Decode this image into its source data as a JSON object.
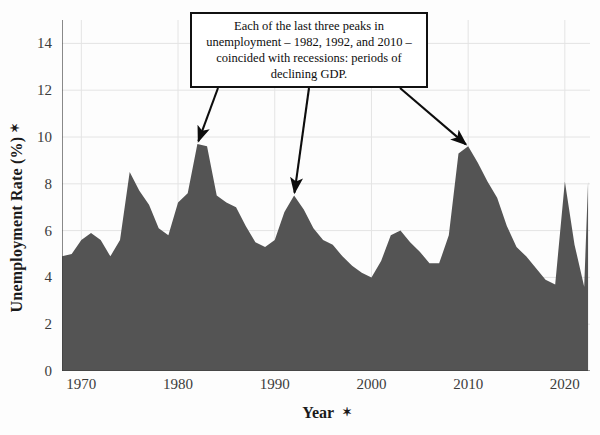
{
  "chart_data": {
    "type": "area",
    "title": "",
    "xlabel": "Year",
    "ylabel": "Unemployment Rate (%)",
    "xlabel_suffix": "✶",
    "ylabel_suffix": "✶",
    "xlim": [
      1968,
      2022.6
    ],
    "ylim": [
      0,
      15
    ],
    "xticks": [
      1970,
      1980,
      1990,
      2000,
      2010,
      2020
    ],
    "xtick_labels": [
      "1970",
      "1980",
      "1990",
      "2000",
      "2010",
      "2020"
    ],
    "yticks": [
      0,
      2,
      4,
      6,
      8,
      10,
      12,
      14
    ],
    "ytick_labels": [
      "0",
      "2",
      "4",
      "6",
      "8",
      "10",
      "12",
      "14"
    ],
    "grid": true,
    "legend": "none",
    "series_name": "Unemployment Rate",
    "fill_color": "#545454",
    "x": [
      1968,
      1969,
      1970,
      1971,
      1972,
      1973,
      1974,
      1975,
      1976,
      1977,
      1978,
      1979,
      1980,
      1981,
      1982,
      1983,
      1984,
      1985,
      1986,
      1987,
      1988,
      1989,
      1990,
      1991,
      1992,
      1993,
      1994,
      1995,
      1996,
      1997,
      1998,
      1999,
      2000,
      2001,
      2002,
      2003,
      2004,
      2005,
      2006,
      2007,
      2008,
      2009,
      2010,
      2011,
      2012,
      2013,
      2014,
      2015,
      2016,
      2017,
      2018,
      2019,
      2020,
      2021,
      2022
    ],
    "values": [
      4.9,
      5.0,
      5.6,
      5.9,
      5.6,
      4.9,
      5.6,
      8.5,
      7.7,
      7.1,
      6.1,
      5.8,
      7.2,
      7.6,
      9.7,
      9.6,
      7.5,
      7.2,
      7.0,
      6.2,
      5.5,
      5.3,
      5.6,
      6.8,
      7.5,
      6.9,
      6.1,
      5.6,
      5.4,
      4.9,
      4.5,
      4.2,
      4.0,
      4.7,
      5.8,
      6.0,
      5.5,
      5.1,
      4.6,
      4.6,
      5.8,
      9.3,
      9.6,
      8.9,
      8.1,
      7.4,
      6.2,
      5.3,
      4.9,
      4.4,
      3.9,
      3.7,
      8.1,
      5.4,
      3.6
    ],
    "final_spike": {
      "year": 2022.4,
      "value": 8.1
    },
    "annotations": [
      {
        "text_lines": [
          "Each of the last three peaks in",
          "unemployment – 1982, 1992, and 2010 –",
          "coincided with recessions: periods of",
          "declining GDP."
        ],
        "arrow_targets": [
          {
            "year": 1982,
            "value": 9.7
          },
          {
            "year": 1992,
            "value": 7.5
          },
          {
            "year": 2010,
            "value": 9.6
          }
        ]
      }
    ]
  },
  "figure": {
    "background_color": "#fdfdfd",
    "axis_color": "#3b3b3b",
    "grid_color": "#e4e4e4",
    "annotation_border_color": "#111111",
    "annotation_background_color": "#ffffff"
  }
}
